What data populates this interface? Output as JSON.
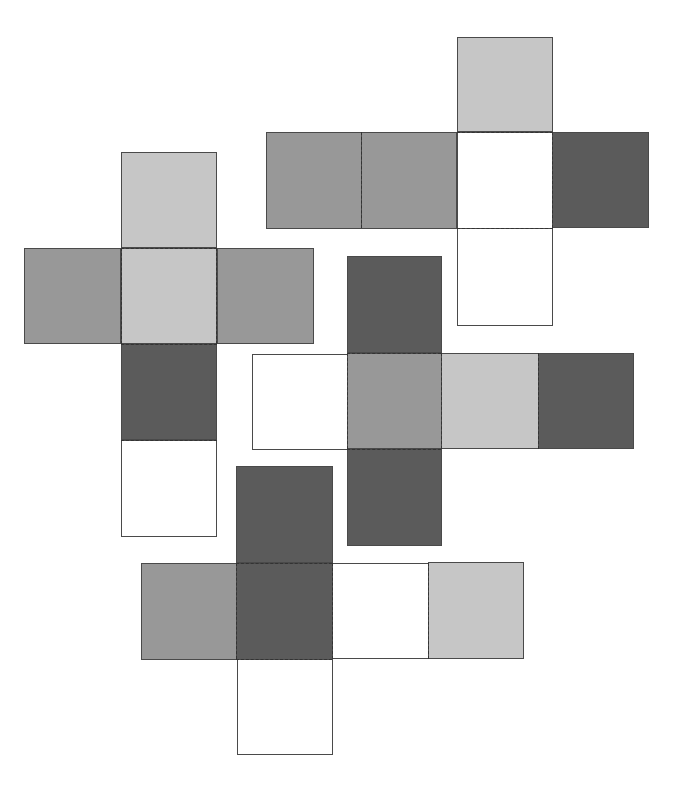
{
  "colors": {
    "light": "#c6c6c6",
    "medium": "#989898",
    "dark": "#5b5b5b",
    "white": "#ffffff",
    "border": "#4a4a4a",
    "fold_line": "#333333"
  },
  "nets": [
    {
      "name": "net-left-cross",
      "faces": [
        {
          "shade": "light",
          "x": 121,
          "y": 152,
          "w": 96,
          "h": 96
        },
        {
          "shade": "medium",
          "x": 24,
          "y": 248,
          "w": 97,
          "h": 96
        },
        {
          "shade": "light",
          "x": 121,
          "y": 248,
          "w": 96,
          "h": 96
        },
        {
          "shade": "medium",
          "x": 217,
          "y": 248,
          "w": 97,
          "h": 96
        },
        {
          "shade": "dark",
          "x": 121,
          "y": 344,
          "w": 96,
          "h": 96
        },
        {
          "shade": "white",
          "x": 121,
          "y": 440,
          "w": 96,
          "h": 97
        }
      ],
      "folds": [
        {
          "dir": "h",
          "x": 121,
          "y": 248,
          "len": 96
        },
        {
          "dir": "h",
          "x": 121,
          "y": 344,
          "len": 96
        },
        {
          "dir": "v",
          "x": 121,
          "y": 248,
          "len": 96
        },
        {
          "dir": "v",
          "x": 216,
          "y": 248,
          "len": 96
        },
        {
          "dir": "h",
          "x": 121,
          "y": 440,
          "len": 96
        }
      ]
    },
    {
      "name": "net-top-right",
      "faces": [
        {
          "shade": "light",
          "x": 457,
          "y": 37,
          "w": 96,
          "h": 95
        },
        {
          "shade": "medium",
          "x": 266,
          "y": 132,
          "w": 96,
          "h": 97
        },
        {
          "shade": "medium",
          "x": 361,
          "y": 132,
          "w": 96,
          "h": 97
        },
        {
          "shade": "white",
          "x": 457,
          "y": 132,
          "w": 96,
          "h": 97
        },
        {
          "shade": "dark",
          "x": 552,
          "y": 132,
          "w": 97,
          "h": 96
        },
        {
          "shade": "white",
          "x": 457,
          "y": 228,
          "w": 96,
          "h": 98
        }
      ],
      "folds": [
        {
          "dir": "v",
          "x": 361,
          "y": 132,
          "len": 96
        },
        {
          "dir": "h",
          "x": 457,
          "y": 132,
          "len": 96
        },
        {
          "dir": "h",
          "x": 457,
          "y": 228,
          "len": 96
        },
        {
          "dir": "v",
          "x": 552,
          "y": 132,
          "len": 96
        }
      ]
    },
    {
      "name": "net-middle-right",
      "faces": [
        {
          "shade": "dark",
          "x": 347,
          "y": 256,
          "w": 95,
          "h": 97
        },
        {
          "shade": "white",
          "x": 252,
          "y": 354,
          "w": 96,
          "h": 96
        },
        {
          "shade": "medium",
          "x": 347,
          "y": 353,
          "w": 95,
          "h": 96
        },
        {
          "shade": "light",
          "x": 441,
          "y": 353,
          "w": 98,
          "h": 96
        },
        {
          "shade": "dark",
          "x": 538,
          "y": 353,
          "w": 96,
          "h": 96
        },
        {
          "shade": "dark",
          "x": 347,
          "y": 449,
          "w": 95,
          "h": 97
        }
      ],
      "folds": [
        {
          "dir": "h",
          "x": 347,
          "y": 353,
          "len": 94
        },
        {
          "dir": "h",
          "x": 347,
          "y": 449,
          "len": 94
        },
        {
          "dir": "v",
          "x": 347,
          "y": 353,
          "len": 96
        },
        {
          "dir": "v",
          "x": 441,
          "y": 353,
          "len": 96
        },
        {
          "dir": "v",
          "x": 538,
          "y": 353,
          "len": 96
        }
      ]
    },
    {
      "name": "net-bottom",
      "faces": [
        {
          "shade": "dark",
          "x": 236,
          "y": 466,
          "w": 97,
          "h": 97
        },
        {
          "shade": "medium",
          "x": 141,
          "y": 563,
          "w": 96,
          "h": 97
        },
        {
          "shade": "dark",
          "x": 236,
          "y": 563,
          "w": 97,
          "h": 97
        },
        {
          "shade": "white",
          "x": 332,
          "y": 563,
          "w": 97,
          "h": 96
        },
        {
          "shade": "light",
          "x": 428,
          "y": 562,
          "w": 96,
          "h": 97
        },
        {
          "shade": "white",
          "x": 237,
          "y": 659,
          "w": 96,
          "h": 96
        }
      ],
      "folds": [
        {
          "dir": "h",
          "x": 236,
          "y": 563,
          "len": 96
        },
        {
          "dir": "h",
          "x": 236,
          "y": 659,
          "len": 96
        },
        {
          "dir": "v",
          "x": 236,
          "y": 563,
          "len": 96
        },
        {
          "dir": "v",
          "x": 332,
          "y": 563,
          "len": 96
        },
        {
          "dir": "v",
          "x": 428,
          "y": 563,
          "len": 96
        }
      ]
    }
  ]
}
